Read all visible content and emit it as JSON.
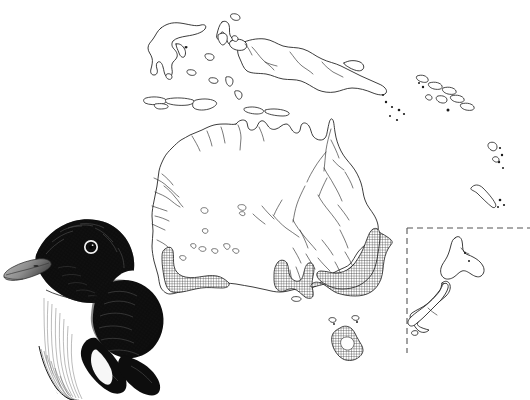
{
  "figure": {
    "kind": "species-distribution-map",
    "region": "Australasia",
    "background_color": "#ffffff",
    "ink_color": "#1a1a1a",
    "caption": "",
    "title": ""
  },
  "map": {
    "name": "australasia-distribution-map",
    "landmasses": [
      {
        "name": "Australia",
        "label": ""
      },
      {
        "name": "New Guinea",
        "label": ""
      },
      {
        "name": "Sulawesi",
        "label": ""
      },
      {
        "name": "Halmahera",
        "label": ""
      },
      {
        "name": "Tasmania",
        "label": ""
      },
      {
        "name": "Lesser Sunda Islands",
        "label": ""
      },
      {
        "name": "Solomon Islands",
        "label": ""
      },
      {
        "name": "Vanuatu",
        "label": ""
      },
      {
        "name": "New Caledonia",
        "label": ""
      }
    ],
    "features": {
      "rivers_shown": "true",
      "salt_lakes_shown": "true",
      "graticule_shown": "false",
      "place_labels_shown": "false"
    }
  },
  "range": {
    "name": "species-range-overlay",
    "style": "crosshatch",
    "fill_color": "#1a1a1a",
    "hatch_spacing_px": "2.6",
    "areas": [
      {
        "name": "south-west-australia",
        "label": ""
      },
      {
        "name": "south-coast-eyre-peninsula",
        "label": ""
      },
      {
        "name": "south-east-australia-coast",
        "label": ""
      },
      {
        "name": "tasmania",
        "label": ""
      }
    ]
  },
  "inset": {
    "name": "new-zealand-inset",
    "border_style": "dashed",
    "border_color": "#555555",
    "label": "",
    "islands": [
      {
        "name": "North Island",
        "label": ""
      },
      {
        "name": "South Island",
        "label": ""
      },
      {
        "name": "Stewart Island",
        "label": ""
      }
    ],
    "range_present": "false"
  },
  "illustration": {
    "name": "bird-head-illustration",
    "medium": "pen-and-ink",
    "subject": "bird head and breast, side profile facing left",
    "plumage": {
      "head": "black",
      "bill": "pale grey",
      "eye_ring": "white",
      "throat_breast": "white",
      "wing_shoulder": "black",
      "collar": "white"
    },
    "caption": ""
  }
}
